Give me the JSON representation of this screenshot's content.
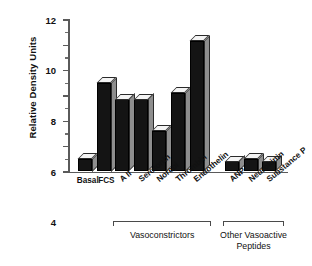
{
  "chart_data": {
    "type": "bar",
    "title": "",
    "xlabel": "",
    "ylabel": "Relative Density Units",
    "ylim": [
      0,
      12
    ],
    "ytick_labels": [
      "0",
      "2",
      "4",
      "6",
      "8",
      "10",
      "12"
    ],
    "yticks": [
      0,
      2,
      4,
      6,
      8,
      10,
      12
    ],
    "yminorticks": [
      1,
      3,
      5,
      7,
      9,
      11
    ],
    "grid": false,
    "legend": "none",
    "style": "3d-bars",
    "categories": [
      "Basal",
      "FCS",
      "A II",
      "Serotonin",
      "Norepi",
      "Thrombin",
      "Endothelin",
      "ANP",
      "Neurokinin",
      "Substance P"
    ],
    "values": [
      1.0,
      7.0,
      5.7,
      5.7,
      3.2,
      6.2,
      10.3,
      0.8,
      1.0,
      0.8
    ],
    "gap_after_index": 6,
    "groups": [
      {
        "label": "Vasoconstrictors",
        "from": "A II",
        "to": "Endothelin",
        "start_index": 2,
        "end_index": 6
      },
      {
        "label": "Other Vasoactive\nPeptides",
        "from": "ANP",
        "to": "Substance P",
        "start_index": 7,
        "end_index": 9
      }
    ],
    "colors": {
      "bar_front": "#141414",
      "bar_side": "#8e8e8e",
      "bar_top": "#f4f4f4",
      "axis": "#5a5a5a",
      "text": "#111111",
      "background": "#ffffff"
    },
    "label_rotation_deg": -40,
    "flat_labels": [
      "Basal",
      "FCS"
    ]
  }
}
